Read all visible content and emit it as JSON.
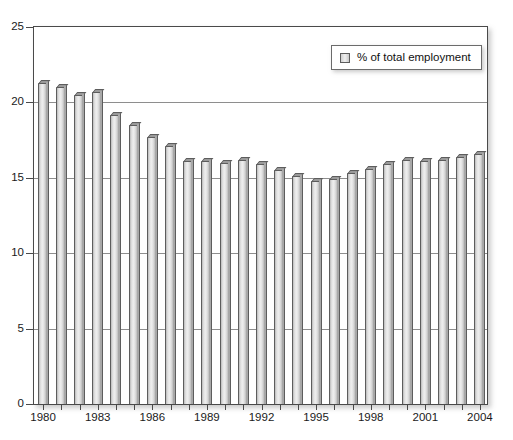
{
  "chart_data": {
    "type": "bar",
    "title": "",
    "subtitle": "",
    "xlabel": "",
    "ylabel": "",
    "ylim": [
      0,
      25
    ],
    "ytick_values": [
      0,
      5,
      10,
      15,
      20,
      25
    ],
    "ytick_labels": [
      "0",
      "5",
      "10",
      "15",
      "20",
      "25"
    ],
    "grid": true,
    "grid_axis": "y",
    "legend_position": "top-right",
    "legend": [
      "% of total employment"
    ],
    "categories": [
      "1980",
      "1981",
      "1982",
      "1983",
      "1984",
      "1985",
      "1986",
      "1987",
      "1988",
      "1989",
      "1990",
      "1991",
      "1992",
      "1993",
      "1994",
      "1995",
      "1996",
      "1997",
      "1998",
      "1999",
      "2000",
      "2001",
      "2002",
      "2003",
      "2004"
    ],
    "xtick_labels": [
      "1980",
      "1983",
      "1986",
      "1989",
      "1992",
      "1995",
      "1998",
      "2001",
      "2004"
    ],
    "series": [
      {
        "name": "% of total employment",
        "values": [
          21.3,
          21.0,
          20.5,
          20.7,
          19.2,
          18.5,
          17.7,
          17.1,
          16.1,
          16.1,
          16.0,
          16.2,
          15.9,
          15.5,
          15.1,
          14.8,
          14.9,
          15.3,
          15.6,
          15.9,
          16.2,
          16.1,
          16.2,
          16.4,
          16.6
        ]
      }
    ]
  },
  "legend": {
    "label": "% of total employment",
    "swatch_color": "#dcdcdc"
  },
  "colors": {
    "bar_fill": "#e4e4e4",
    "bar_edge": "#5d5d5d",
    "grid": "#8e8e8e",
    "frame": "#4a4a4a",
    "text": "#1a1a1a",
    "background": "#ffffff"
  }
}
